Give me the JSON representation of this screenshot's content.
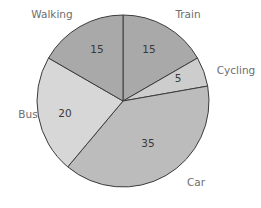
{
  "chart_data": {
    "type": "pie",
    "title": "",
    "categories": [
      "Train",
      "Cycling",
      "Car",
      "Bus",
      "Walking"
    ],
    "values": [
      15,
      5,
      35,
      20,
      15
    ],
    "colors": [
      "#a9a9a9",
      "#cdcdcd",
      "#bcbcbc",
      "#d7d7d7",
      "#a9a9a9"
    ],
    "start_angle_deg": 0,
    "direction": "clockwise",
    "legend": "none (slice labels outside)",
    "value_labels": "inside slices"
  }
}
